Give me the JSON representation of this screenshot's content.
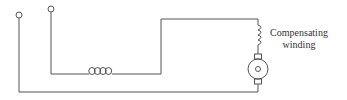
{
  "diagram": {
    "type": "circuit",
    "labels": {
      "compensating_winding_line1": "Compensating",
      "compensating_winding_line2": "winding"
    },
    "components": [
      {
        "id": "terminal-1",
        "kind": "terminal",
        "icon": "open-circle"
      },
      {
        "id": "terminal-2",
        "kind": "terminal",
        "icon": "open-circle"
      },
      {
        "id": "series-field",
        "kind": "inductor-coil",
        "icon": "coil-loops"
      },
      {
        "id": "compensating-winding",
        "kind": "inductor-coil",
        "icon": "coil-vertical"
      },
      {
        "id": "armature",
        "kind": "motor-armature",
        "icon": "circle-with-brushes"
      }
    ],
    "colors": {
      "wire": "#555555",
      "text": "#333333",
      "background": "#ffffff"
    }
  }
}
